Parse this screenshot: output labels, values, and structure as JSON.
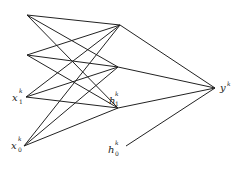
{
  "diagram": {
    "type": "neural-network",
    "nodes": [
      {
        "id": "a",
        "x": 27,
        "y": 15,
        "label": ""
      },
      {
        "id": "b",
        "x": 27,
        "y": 55,
        "label": ""
      },
      {
        "id": "x1",
        "x": 26,
        "y": 97,
        "label": "x",
        "sup": "k",
        "sub": "1"
      },
      {
        "id": "x0",
        "x": 24,
        "y": 146,
        "label": "x",
        "sup": "k",
        "sub": "0"
      },
      {
        "id": "h2",
        "x": 120,
        "y": 25,
        "label": ""
      },
      {
        "id": "h3",
        "x": 118,
        "y": 67,
        "label": ""
      },
      {
        "id": "h1",
        "x": 118,
        "y": 108,
        "label": "h",
        "sup": "k",
        "sub": "1"
      },
      {
        "id": "h0",
        "x": 126,
        "y": 146,
        "label": "h",
        "sup": "k",
        "sub": "0"
      },
      {
        "id": "y",
        "x": 215,
        "y": 88,
        "label": "y",
        "sup": "k"
      }
    ],
    "edges": [
      [
        "a",
        "h2"
      ],
      [
        "a",
        "h3"
      ],
      [
        "a",
        "h1"
      ],
      [
        "b",
        "h2"
      ],
      [
        "b",
        "h3"
      ],
      [
        "b",
        "h1"
      ],
      [
        "x1",
        "h2"
      ],
      [
        "x1",
        "h3"
      ],
      [
        "x1",
        "h1"
      ],
      [
        "x0",
        "h2"
      ],
      [
        "x0",
        "h3"
      ],
      [
        "x0",
        "h1"
      ],
      [
        "h2",
        "y"
      ],
      [
        "h3",
        "y"
      ],
      [
        "h1",
        "y"
      ],
      [
        "h0",
        "y"
      ]
    ],
    "labels": {
      "x1": {
        "base": "x",
        "sup": "k",
        "sub": "1"
      },
      "x0": {
        "base": "x",
        "sup": "k",
        "sub": "0"
      },
      "h1": {
        "base": "h",
        "sup": "k",
        "sub": "1"
      },
      "h0": {
        "base": "h",
        "sup": "k",
        "sub": "0"
      },
      "y": {
        "base": "y",
        "sup": "k"
      }
    }
  }
}
